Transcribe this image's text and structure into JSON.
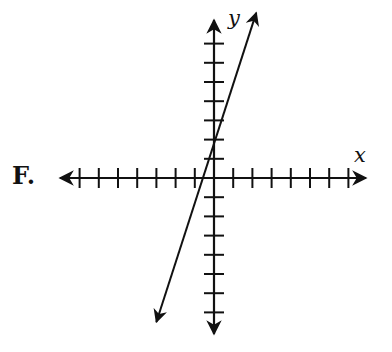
{
  "option_label": "F.",
  "chart_data": {
    "type": "line",
    "title": "",
    "xlabel": "x",
    "ylabel": "y",
    "xlim": [
      -7,
      7
    ],
    "ylim": [
      -7,
      7
    ],
    "grid": false,
    "tick_labels": false,
    "x_ticks": [
      -7,
      -6,
      -5,
      -4,
      -3,
      -2,
      -1,
      1,
      2,
      3,
      4,
      5,
      6,
      7
    ],
    "y_ticks": [
      -7,
      -6,
      -5,
      -4,
      -3,
      -2,
      -1,
      1,
      2,
      3,
      4,
      5,
      6,
      7
    ],
    "series": [
      {
        "name": "line",
        "slope": 3,
        "y_intercept": 2,
        "x": [
          -3,
          2.2
        ],
        "y": [
          -7.5,
          8.6
        ],
        "arrows": "both"
      }
    ]
  },
  "colors": {
    "stroke": "#111111",
    "background": "#ffffff"
  }
}
